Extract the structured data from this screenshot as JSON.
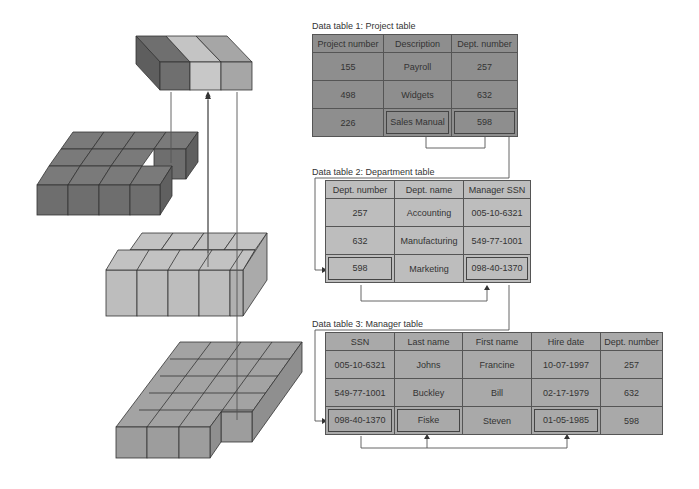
{
  "tables": {
    "project": {
      "caption": "Data table 1: Project table",
      "headers": [
        "Project number",
        "Description",
        "Dept. number"
      ],
      "rows": [
        [
          "155",
          "Payroll",
          "257"
        ],
        [
          "498",
          "Widgets",
          "632"
        ],
        [
          "226",
          "Sales Manual",
          "598"
        ]
      ]
    },
    "department": {
      "caption": "Data table 2: Department table",
      "headers": [
        "Dept. number",
        "Dept. name",
        "Manager SSN"
      ],
      "rows": [
        [
          "257",
          "Accounting",
          "005-10-6321"
        ],
        [
          "632",
          "Manufacturing",
          "549-77-1001"
        ],
        [
          "598",
          "Marketing",
          "098-40-1370"
        ]
      ]
    },
    "manager": {
      "caption": "Data table 3: Manager table",
      "headers": [
        "SSN",
        "Last name",
        "First name",
        "Hire date",
        "Dept. number"
      ],
      "rows": [
        [
          "005-10-6321",
          "Johns",
          "Francine",
          "10-07-1997",
          "257"
        ],
        [
          "549-77-1001",
          "Buckley",
          "Bill",
          "02-17-1979",
          "632"
        ],
        [
          "098-40-1370",
          "Fiske",
          "Steven",
          "01-05-1985",
          "598"
        ]
      ]
    }
  },
  "colors": {
    "result_block_dark": "#6f6f6f",
    "result_block_light": "#c4c4c4",
    "result_block_mid": "#a6a6a6",
    "project_block": "#7a7a7a",
    "department_block": "#bdbdbd",
    "manager_block": "#a3a3a3",
    "line": "#555555"
  }
}
